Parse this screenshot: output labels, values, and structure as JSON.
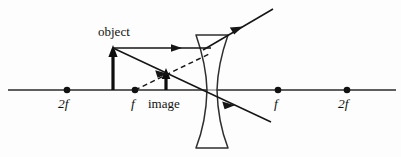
{
  "figure": {
    "background_color": "#fdfdfd",
    "ink_color": "#111111",
    "width": 401,
    "height": 157
  },
  "axis": {
    "name": "principal-axis",
    "y": 90,
    "x_start": 8,
    "x_end": 396
  },
  "focal_points": [
    {
      "id": "left-2f",
      "label": "2f",
      "x": 67,
      "y": 90,
      "label_x": 58,
      "label_y": 97
    },
    {
      "id": "left-f",
      "label": "f",
      "x": 135,
      "y": 90,
      "label_x": 131,
      "label_y": 97
    },
    {
      "id": "right-f",
      "label": "f",
      "x": 278,
      "y": 90,
      "label_x": 274,
      "label_y": 97
    },
    {
      "id": "right-2f",
      "label": "2f",
      "x": 347,
      "y": 90,
      "label_x": 338,
      "label_y": 97
    }
  ],
  "labels": {
    "object": {
      "text": "object",
      "x": 98,
      "y": 25
    },
    "image": {
      "text": "image",
      "x": 148,
      "y": 97
    }
  },
  "object_arrow": {
    "name": "object-arrow",
    "x": 113,
    "base_y": 90,
    "tip_y": 48,
    "height_px": 42,
    "stroke_width": 3
  },
  "image_arrow": {
    "name": "image-arrow",
    "x": 166,
    "base_y": 90,
    "tip_y": 70,
    "height_px": 20,
    "stroke_width": 3
  },
  "lens": {
    "name": "diverging-lens",
    "type": "biconcave",
    "top_y": 35,
    "bottom_y": 148,
    "top_left_x": 196,
    "top_right_x": 228,
    "bottom_left_x": 196,
    "bottom_right_x": 228,
    "waist_x_left": 207,
    "waist_x_right": 217,
    "waist_y": 90
  },
  "rays": [
    {
      "id": "incident-parallel-ray",
      "style": "solid",
      "description": "Parallel ray from object tip to lens",
      "x1": 113,
      "y1": 48,
      "x2": 210,
      "y2": 48,
      "arrow_at": {
        "x": 175,
        "y": 48,
        "angle_deg": 0
      }
    },
    {
      "id": "refracted-diverging-ray",
      "style": "solid",
      "description": "Refracted ray diverging upward to the right",
      "x1": 206,
      "y1": 48,
      "x2": 272,
      "y2": 10,
      "arrow_at": {
        "x": 237,
        "y": 28,
        "angle_deg": -30
      }
    },
    {
      "id": "center-ray",
      "style": "solid",
      "description": "Ray through optical centre, object tip through lens centre and onward",
      "x1": 113,
      "y1": 48,
      "x2": 270,
      "y2": 122,
      "arrow_at": {
        "x": 160,
        "y": 70,
        "angle_deg": 25
      },
      "arrow2_at": {
        "x": 228,
        "y": 102,
        "angle_deg": 25
      }
    },
    {
      "id": "virtual-ray-dashed",
      "style": "dashed",
      "description": "Dashed back-extension of refracted ray to virtual image tip",
      "x1": 135,
      "y1": 90,
      "x2": 208,
      "y2": 55
    }
  ],
  "arrowheads": {
    "style": "solid filled triangle",
    "length": 9,
    "half_width": 3.5
  }
}
